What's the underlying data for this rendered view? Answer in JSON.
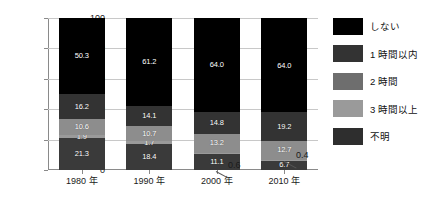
{
  "chart_data": {
    "type": "bar",
    "subtype": "stacked-100",
    "title": "",
    "xlabel": "",
    "ylabel": "",
    "ylim": [
      0,
      100
    ],
    "yticks": [
      0,
      20,
      40,
      60,
      80,
      100
    ],
    "grid": true,
    "legend_position": "right",
    "categories": [
      "1980 年",
      "1990 年",
      "2000 年",
      "2010 年"
    ],
    "series": [
      {
        "name": "不明",
        "values": [
          21.3,
          18.4,
          11.1,
          6.7
        ],
        "color": "#3a3a3a"
      },
      {
        "name": "3 時間以上",
        "values": [
          1.9,
          1.7,
          0.6,
          0.4
        ],
        "color": "#9a9a9a"
      },
      {
        "name": "2 時間",
        "values": [
          10.6,
          10.7,
          13.2,
          12.7
        ],
        "color": "#8d8d8d"
      },
      {
        "name": "1 時間以内",
        "values": [
          16.2,
          14.1,
          14.8,
          19.2
        ],
        "color": "#333333"
      },
      {
        "name": "しない",
        "values": [
          50.3,
          61.2,
          64.0,
          64.0
        ],
        "color": "#000000"
      }
    ],
    "callouts": [
      {
        "text": "0.6",
        "category": "2000 年",
        "series": "3 時間以上"
      },
      {
        "text": "0.4",
        "category": "2010 年",
        "series": "3 時間以上"
      }
    ]
  },
  "legend": {
    "items": [
      {
        "label": "しない",
        "color": "#000000"
      },
      {
        "label": "1 時間以内",
        "color": "#333333"
      },
      {
        "label": "2 時間",
        "color": "#6e6e6e"
      },
      {
        "label": "3 時間以上",
        "color": "#9a9a9a"
      },
      {
        "label": "不明",
        "color": "#2e2e2e"
      }
    ]
  },
  "yticks": [
    {
      "label": "100"
    },
    {
      "label": "80"
    },
    {
      "label": "60"
    },
    {
      "label": "40"
    },
    {
      "label": "20"
    },
    {
      "label": "0"
    }
  ],
  "bars": [
    {
      "category": "1980 年",
      "segments": [
        {
          "series": "不明",
          "label": "21.3",
          "value": 21.3,
          "color": "#3a3a3a",
          "show_label": true
        },
        {
          "series": "3 時間以上",
          "label": "1.9",
          "value": 1.9,
          "color": "#9a9a9a",
          "show_label": true
        },
        {
          "series": "2 時間",
          "label": "10.6",
          "value": 10.6,
          "color": "#8d8d8d",
          "show_label": true
        },
        {
          "series": "1 時間以内",
          "label": "16.2",
          "value": 16.2,
          "color": "#333333",
          "show_label": true
        },
        {
          "series": "しない",
          "label": "50.3",
          "value": 50.3,
          "color": "#000000",
          "show_label": true
        }
      ]
    },
    {
      "category": "1990 年",
      "segments": [
        {
          "series": "不明",
          "label": "18.4",
          "value": 18.4,
          "color": "#3a3a3a",
          "show_label": true
        },
        {
          "series": "3 時間以上",
          "label": "1.7",
          "value": 1.7,
          "color": "#9a9a9a",
          "show_label": true
        },
        {
          "series": "2 時間",
          "label": "10.7",
          "value": 10.7,
          "color": "#8d8d8d",
          "show_label": true
        },
        {
          "series": "1 時間以内",
          "label": "14.1",
          "value": 14.1,
          "color": "#333333",
          "show_label": true
        },
        {
          "series": "しない",
          "label": "61.2",
          "value": 61.2,
          "color": "#000000",
          "show_label": true
        }
      ]
    },
    {
      "category": "2000 年",
      "segments": [
        {
          "series": "不明",
          "label": "11.1",
          "value": 11.1,
          "color": "#3a3a3a",
          "show_label": true
        },
        {
          "series": "3 時間以上",
          "label": "0.6",
          "value": 0.6,
          "color": "#9a9a9a",
          "show_label": false
        },
        {
          "series": "2 時間",
          "label": "13.2",
          "value": 13.2,
          "color": "#8d8d8d",
          "show_label": true
        },
        {
          "series": "1 時間以内",
          "label": "14.8",
          "value": 14.8,
          "color": "#333333",
          "show_label": true
        },
        {
          "series": "しない",
          "label": "64.0",
          "value": 64.0,
          "color": "#000000",
          "show_label": true
        }
      ]
    },
    {
      "category": "2010 年",
      "segments": [
        {
          "series": "不明",
          "label": "6.7",
          "value": 6.7,
          "color": "#3a3a3a",
          "show_label": true
        },
        {
          "series": "3 時間以上",
          "label": "0.4",
          "value": 0.4,
          "color": "#9a9a9a",
          "show_label": false
        },
        {
          "series": "2 時間",
          "label": "12.7",
          "value": 12.7,
          "color": "#8d8d8d",
          "show_label": true
        },
        {
          "series": "1 時間以内",
          "label": "19.2",
          "value": 19.2,
          "color": "#333333",
          "show_label": true
        },
        {
          "series": "しない",
          "label": "64.0",
          "value": 64.0,
          "color": "#000000",
          "show_label": true
        }
      ]
    }
  ],
  "callouts": [
    {
      "text": "0.6",
      "left": 228,
      "top": 160
    },
    {
      "text": "0.4",
      "left": 296,
      "top": 150
    }
  ],
  "xlabels": [
    {
      "label": "1980 年"
    },
    {
      "label": "1990 年"
    },
    {
      "label": "2000 年"
    },
    {
      "label": "2010 年"
    }
  ]
}
